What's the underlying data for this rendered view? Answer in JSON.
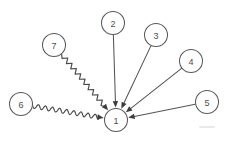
{
  "diagram": {
    "background_color": "#ffffff",
    "stroke_color": "#555555",
    "label_color": "#4d4d4d",
    "arrow_color": "#3d3d3d",
    "node_radius": 11.5,
    "nodes": [
      {
        "id": "1",
        "label": "1",
        "cx": 116,
        "cy": 120,
        "r": 11.5,
        "role": "target"
      },
      {
        "id": "2",
        "label": "2",
        "cx": 113,
        "cy": 23,
        "r": 11.5,
        "role": "source"
      },
      {
        "id": "3",
        "label": "3",
        "cx": 156,
        "cy": 35,
        "r": 11.5,
        "role": "source"
      },
      {
        "id": "4",
        "label": "4",
        "cx": 191,
        "cy": 61,
        "r": 11.5,
        "role": "source"
      },
      {
        "id": "5",
        "label": "5",
        "cx": 207,
        "cy": 102,
        "r": 11.5,
        "role": "source"
      },
      {
        "id": "6",
        "label": "6",
        "cx": 21,
        "cy": 104,
        "r": 11.5,
        "role": "source"
      },
      {
        "id": "7",
        "label": "7",
        "cx": 54,
        "cy": 45,
        "r": 11.5,
        "role": "source"
      }
    ],
    "edges": [
      {
        "id": "edge-2-1",
        "from": "2",
        "to": "1",
        "style": "straight",
        "arrow": "to"
      },
      {
        "id": "edge-3-1",
        "from": "3",
        "to": "1",
        "style": "straight",
        "arrow": "to"
      },
      {
        "id": "edge-4-1",
        "from": "4",
        "to": "1",
        "style": "straight",
        "arrow": "to"
      },
      {
        "id": "edge-5-1",
        "from": "5",
        "to": "1",
        "style": "straight",
        "arrow": "to"
      },
      {
        "id": "edge-6-1",
        "from": "6",
        "to": "1",
        "style": "wavy",
        "arrow": "to"
      },
      {
        "id": "edge-7-1",
        "from": "7",
        "to": "1",
        "style": "zigzag",
        "arrow": "to"
      }
    ]
  }
}
